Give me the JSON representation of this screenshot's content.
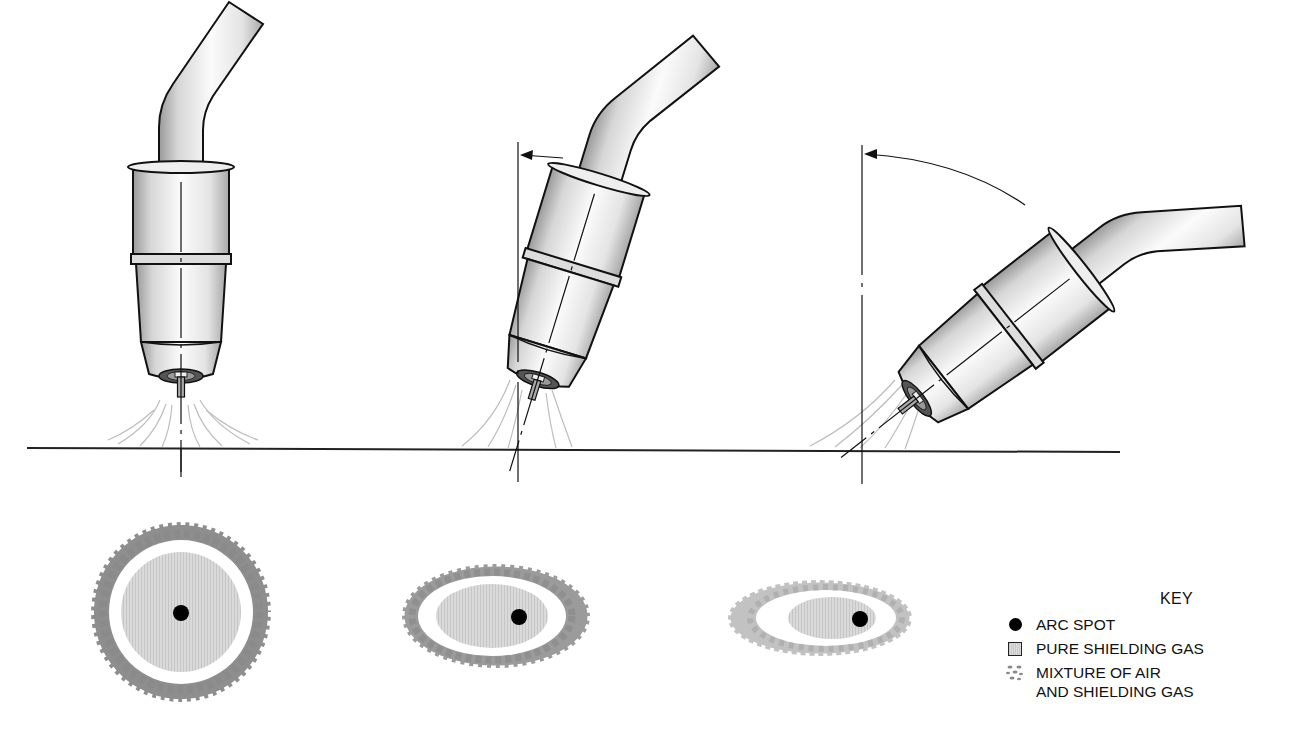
{
  "figure": {
    "colors": {
      "outline": "#111111",
      "ground_line": "#222222",
      "pure_gas_fill": "#d4d4d4",
      "mixture_particles": "#7a7a7a",
      "arc_spot": "#000000",
      "gas_flow_lines": "#bdbdbd"
    },
    "torches": [
      {
        "id": "torch-vertical",
        "tilt": "0° (perpendicular)",
        "has_angle_arrow": false
      },
      {
        "id": "torch-slight-tilt",
        "tilt": "slight angle from vertical",
        "has_angle_arrow": true
      },
      {
        "id": "torch-steep-tilt",
        "tilt": "large angle from vertical",
        "has_angle_arrow": true
      }
    ],
    "coverage_patterns": [
      {
        "id": "pattern-vertical",
        "shape": "circle",
        "arc_spot_position": "centered"
      },
      {
        "id": "pattern-slight-tilt",
        "shape": "ellipse",
        "arc_spot_position": "offset right"
      },
      {
        "id": "pattern-steep-tilt",
        "shape": "narrow ellipse",
        "arc_spot_position": "offset far right"
      }
    ]
  },
  "key": {
    "title": "KEY",
    "items": [
      {
        "icon": "arc-spot-dot-icon",
        "label": "ARC SPOT"
      },
      {
        "icon": "pure-gas-square-icon",
        "label": "PURE SHIELDING GAS"
      },
      {
        "icon": "mixture-particles-icon",
        "label": "MIXTURE OF AIR\nAND SHIELDING GAS"
      }
    ]
  }
}
